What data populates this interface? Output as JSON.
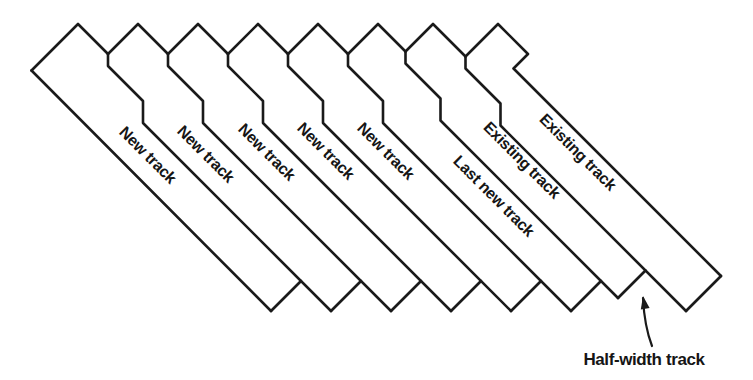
{
  "canvas": {
    "width": 753,
    "height": 380,
    "background": "#ffffff"
  },
  "style": {
    "line_color": "#1a1a1a",
    "line_width": 2.6,
    "text_color": "#151515",
    "track_label_font_size": 16,
    "annotation_font_size": 17
  },
  "track_labels": [
    {
      "text": "New track",
      "x": 148,
      "y": 155,
      "rotation": 45
    },
    {
      "text": "New track",
      "x": 206,
      "y": 154,
      "rotation": 45
    },
    {
      "text": "New track",
      "x": 267,
      "y": 152,
      "rotation": 45
    },
    {
      "text": "New track",
      "x": 326,
      "y": 151,
      "rotation": 45
    },
    {
      "text": "New track",
      "x": 386,
      "y": 151,
      "rotation": 45
    },
    {
      "text": "Last new track",
      "x": 494,
      "y": 196,
      "rotation": 45
    },
    {
      "text": "Existing track",
      "x": 522,
      "y": 160,
      "rotation": 45
    },
    {
      "text": "Existing track",
      "x": 578,
      "y": 152,
      "rotation": 45
    }
  ],
  "annotation": {
    "text": "Half-width track",
    "x": 644,
    "y": 359,
    "arrow_path": "M 652 346 C 647 333 644 318 643 298",
    "arrowhead_points": "643,296 649.6,307.9 640.8,309.5"
  },
  "geometry": {
    "track_top_outlines": [
      "M 31.5 70.5 L 78 24 L 108 54",
      "M 108 54 L 138 24 L 168 54",
      "M 168 54 L 198 24 L 228 54",
      "M 228 54 L 258 24 L 288 54",
      "M 288 54 L 318 24 L 348 54",
      "M 348 54 L 378 24 L 405.5 51.5",
      "M 405.5 51.5 L 433 24 L 465.5 56.5",
      "M 465.5 56.5 L 498 24 L 528 54 L 513.5 68.5 L 721 276"
    ],
    "junction_lines": [
      "M 108 54 L 108 66 L 143 101 L 143 123 L 331 311",
      "M 168 54 L 168 66 L 203 101 L 203 123 L 391 311",
      "M 228 54 L 228 66 L 263 101 L 263 123 L 451 311",
      "M 288 54 L 288 66 L 323 101 L 323 123 L 511 311",
      "M 348 54 L 348 66 L 383 101 L 383 123 L 571 311",
      "M 405.5 51.5 L 405.5 63.5 L 440.5 98.5 L 440.5 120.5 L 618 298",
      "M 465.5 56.5 L 465.5 68.5 L 500.5 103.5 L 500.5 125.5 L 686 311"
    ],
    "track1_left_edge": "M 31.5 70.5 L 271 311",
    "bottom_edges": [
      "M 271 311 L 301 281",
      "M 331 311 L 361 281",
      "M 391 311 L 421 281",
      "M 451 311 L 481 281",
      "M 511 311 L 541 281",
      "M 571 311 L 601 281",
      "M 618 298 L 645.5 270.5",
      "M 686 311 L 721 276"
    ]
  }
}
